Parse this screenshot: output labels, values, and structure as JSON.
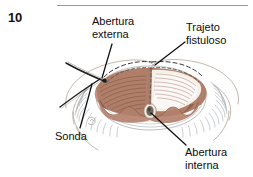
{
  "figure": {
    "number": "10",
    "rule": true,
    "colors": {
      "text": "#0d0d0d",
      "rule": "#9a9a9a",
      "mucosa": "#a87461",
      "mucosa_light": "#d8b6a4",
      "mucosa_dark": "#7c4c3b",
      "muscle_gray": "#8d9297",
      "skin_outline": "#b7a89c",
      "leader": "#121212",
      "probe": "#1a1a1a",
      "internal_opening": "#6b6257"
    }
  },
  "labels": {
    "abertura_externa": "Abertura\nexterna",
    "abertura_externa_line1": "Abertura",
    "abertura_externa_line2": "externa",
    "trajeto_fistuloso_line1": "Trajeto",
    "trajeto_fistuloso_line2": "fistuloso",
    "sonda": "Sonda",
    "abertura_interna_line1": "Abertura",
    "abertura_interna_line2": "interna"
  },
  "illustration": {
    "title": "anal-fistula-anatomy",
    "description": "Perianal region drawn in cutaway view showing the anal canal with brown mucosal folds, radiating sphincter muscle fibres, a dashed fistula tract running beneath the skin, a metal probe (sonda) passed through the external opening, and the internal opening at the dentate line.",
    "parts": [
      "external-opening",
      "fistula-tract",
      "probe",
      "internal-opening",
      "anal-canal-mucosa",
      "sphincter-fibres",
      "perianal-skin"
    ]
  }
}
